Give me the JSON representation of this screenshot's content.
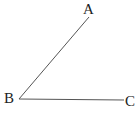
{
  "figure": {
    "type": "angle",
    "points": [
      {
        "label": "A",
        "x": 89,
        "y": 17,
        "label_x": 83,
        "label_y": 14
      },
      {
        "label": "B",
        "x": 19,
        "y": 99,
        "label_x": 4,
        "label_y": 103
      },
      {
        "label": "C",
        "x": 124,
        "y": 100,
        "label_x": 125,
        "label_y": 106
      }
    ],
    "segments": [
      [
        "B",
        "A"
      ],
      [
        "B",
        "C"
      ]
    ],
    "line_color": "#555555"
  }
}
